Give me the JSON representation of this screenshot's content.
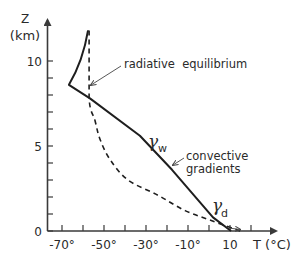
{
  "chart_data": {
    "type": "line",
    "title": "",
    "xlabel": "T (°C)",
    "ylabel": "Z (km)",
    "xlim": [
      -75,
      22
    ],
    "ylim": [
      0,
      12.5
    ],
    "x_ticks": [
      -70,
      -60,
      -50,
      -40,
      -30,
      -20,
      -10,
      0,
      10,
      20
    ],
    "x_tick_labels": [
      "-70°",
      "-50°",
      "-30°",
      "-10°",
      "10"
    ],
    "x_tick_label_values": [
      -70,
      -50,
      -30,
      -10,
      10
    ],
    "y_ticks": [
      0,
      1,
      2,
      3,
      4,
      5,
      6,
      7,
      8,
      9,
      10
    ],
    "y_tick_labels": [
      "0",
      "5",
      "10"
    ],
    "y_tick_label_values": [
      0,
      5,
      10
    ],
    "grid": false,
    "legend": null,
    "series": [
      {
        "name": "convective gradients",
        "style": "solid",
        "points": [
          {
            "T": 10.5,
            "z": 0.0
          },
          {
            "T": 1.9,
            "z": 0.8
          },
          {
            "T": -17.6,
            "z": 3.6
          },
          {
            "T": -32.9,
            "z": 5.6
          },
          {
            "T": -56.7,
            "z": 7.8
          },
          {
            "T": -66.7,
            "z": 8.6
          },
          {
            "T": -62.4,
            "z": 9.5
          },
          {
            "T": -59.5,
            "z": 10.6
          },
          {
            "T": -57.6,
            "z": 11.8
          }
        ]
      },
      {
        "name": "radiative equilibrium",
        "style": "dashed",
        "points": [
          {
            "T": 14.8,
            "z": 0.0
          },
          {
            "T": 1.4,
            "z": 0.6
          },
          {
            "T": -11.4,
            "z": 1.2
          },
          {
            "T": -24.3,
            "z": 2.1
          },
          {
            "T": -38.6,
            "z": 3.0
          },
          {
            "T": -47.1,
            "z": 4.2
          },
          {
            "T": -51.9,
            "z": 5.4
          },
          {
            "T": -54.3,
            "z": 6.5
          },
          {
            "T": -57.1,
            "z": 7.8
          },
          {
            "T": -57.1,
            "z": 11.8
          }
        ]
      }
    ],
    "annotations": [
      {
        "text": "radiative equilibrium",
        "points_to": {
          "T": -56.7,
          "z": 8.5
        }
      },
      {
        "text": "convective gradients",
        "points_to": {
          "T": -23,
          "z": 4.1
        }
      },
      {
        "text": "γw",
        "symbol": "γ",
        "subscript": "w",
        "near": {
          "T": -30,
          "z": 5.4
        }
      },
      {
        "text": "γd",
        "symbol": "γ",
        "subscript": "d",
        "near": {
          "T": 2,
          "z": 1.6
        }
      }
    ]
  },
  "labels": {
    "y_axis_var": "Z",
    "y_axis_unit": "(km)",
    "x_axis": "T (°C)",
    "radiative": "radiative  equilibrium",
    "convective_line1": "convective",
    "convective_line2": "gradients",
    "gamma": "γ",
    "gamma_w_sub": "w",
    "gamma_d_sub": "d"
  }
}
